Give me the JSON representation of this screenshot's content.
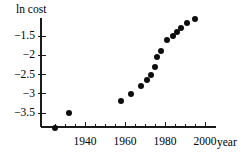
{
  "chart_data": {
    "type": "scatter",
    "title": "",
    "xlabel": "year",
    "ylabel": "ln cost",
    "xlim": [
      1922,
      2002
    ],
    "ylim": [
      -4.05,
      -0.85
    ],
    "grid": false,
    "legend": null,
    "x_ticks_labeled": [
      1940,
      1960,
      1980,
      2000
    ],
    "x_tick_labels": [
      "1940",
      "1960",
      "1980",
      "2000"
    ],
    "x_minor_tick_step": 5,
    "y_ticks_labeled": [
      -1.5,
      -2,
      -2.5,
      -3,
      -3.5
    ],
    "y_tick_labels": [
      "−1.5",
      "−2",
      "−2.5",
      "−3",
      "−3.5"
    ],
    "x": [
      1925,
      1932,
      1958,
      1963,
      1968,
      1971,
      1973,
      1975,
      1976,
      1978,
      1981,
      1984,
      1986,
      1988,
      1991,
      1995
    ],
    "values": [
      -3.9,
      -3.5,
      -3.2,
      -3.0,
      -2.8,
      -2.65,
      -2.5,
      -2.3,
      -2.05,
      -1.9,
      -1.6,
      -1.5,
      -1.4,
      -1.3,
      -1.15,
      -1.05
    ],
    "marker": "filled-circle",
    "marker_color": "#0d0d0d",
    "marker_size": 6
  },
  "axis": {
    "x_title": "year",
    "y_title": "ln cost",
    "line_color": "#1a1a1a"
  }
}
